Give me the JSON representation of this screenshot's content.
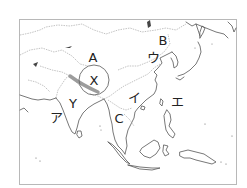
{
  "map": {
    "frame": {
      "x": 19,
      "y": 19,
      "w": 218,
      "h": 166
    },
    "colors": {
      "coast": "#555555",
      "border": "#9a9a9a",
      "range": "#999999",
      "circle": "#6a6a6a",
      "text": "#222222"
    },
    "labels": [
      {
        "id": "A",
        "text": "A",
        "x": 93,
        "y": 57
      },
      {
        "id": "B",
        "text": "B",
        "x": 163,
        "y": 40
      },
      {
        "id": "X",
        "text": "X",
        "x": 94,
        "y": 80
      },
      {
        "id": "Y",
        "text": "Y",
        "x": 73,
        "y": 103
      },
      {
        "id": "C",
        "text": "C",
        "x": 119,
        "y": 118
      },
      {
        "id": "a",
        "text": "ア",
        "x": 56,
        "y": 117
      },
      {
        "id": "i",
        "text": "イ",
        "x": 134,
        "y": 97
      },
      {
        "id": "u",
        "text": "ウ",
        "x": 153,
        "y": 57
      },
      {
        "id": "e",
        "text": "エ",
        "x": 177,
        "y": 101
      }
    ],
    "features": [
      {
        "id": "circle-x",
        "type": "ellipse",
        "cx": 94,
        "cy": 80,
        "rx": 15,
        "ry": 15
      },
      {
        "id": "mountain-range",
        "type": "band",
        "desc": "Himalaya shaded band"
      }
    ]
  }
}
